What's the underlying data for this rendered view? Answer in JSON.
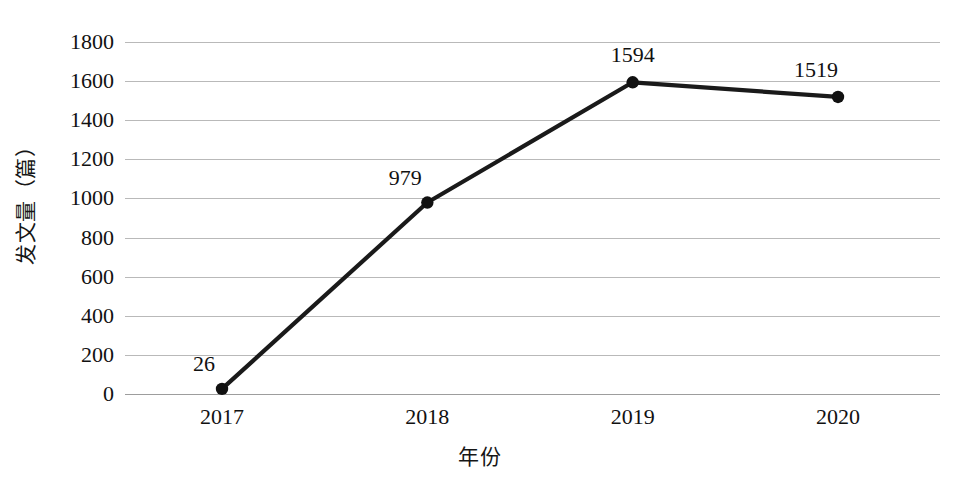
{
  "chart_data": {
    "type": "line",
    "title": "",
    "xlabel": "年份",
    "ylabel": "发文量（篇）",
    "categories": [
      "2017",
      "2018",
      "2019",
      "2020"
    ],
    "values": [
      26,
      979,
      1594,
      1519
    ],
    "series": [
      {
        "name": "发文量",
        "values": [
          26,
          979,
          1594,
          1519
        ]
      }
    ],
    "point_labels": [
      "26",
      "979",
      "1594",
      "1519"
    ],
    "ylim": [
      0,
      1800
    ],
    "ytick_step": 200,
    "ytick_labels": [
      "1800",
      "1600",
      "1400",
      "1200",
      "1000",
      "800",
      "600",
      "400",
      "200",
      "0"
    ],
    "ytick_values": [
      1800,
      1600,
      1400,
      1200,
      1000,
      800,
      600,
      400,
      200,
      0
    ],
    "grid": "horizontal",
    "legend": "none",
    "colors": {
      "line": "#1a1a1a",
      "marker": "#111111",
      "gridline": "#b9b9b9",
      "baseline": "#9d9d9d",
      "background": "#ffffff",
      "text": "#111111"
    },
    "label_offsets": [
      {
        "dx": -18,
        "dy": -14
      },
      {
        "dx": -22,
        "dy": -14
      },
      {
        "dx": 0,
        "dy": -16
      },
      {
        "dx": -22,
        "dy": -16
      }
    ]
  }
}
